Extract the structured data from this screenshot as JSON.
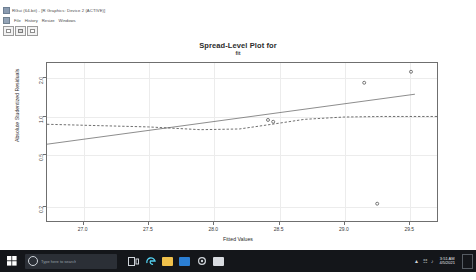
{
  "window": {
    "title": "RGui (64-bit) - [R Graphics: Device 2 (ACTIVE)]",
    "app_icon": "r-app-icon",
    "doc_icon": "r-document-icon",
    "menu": [
      "File",
      "History",
      "Resize",
      "Windows"
    ],
    "toolbar_buttons": [
      "copy-button",
      "print-button",
      "save-button"
    ]
  },
  "taskbar": {
    "start_label": "start-button",
    "search_placeholder": "Type here to search",
    "icons": [
      "task-view-icon",
      "edge-icon",
      "file-explorer-icon",
      "store-icon",
      "settings-icon",
      "r-taskbar-icon"
    ],
    "tray": [
      "show-hidden-icons",
      "network-icon",
      "volume-icon",
      "action-center-icon"
    ],
    "time": "3:51 AM",
    "date": "4/5/2021"
  },
  "chart_data": {
    "type": "scatter",
    "title": "Spread-Level Plot for",
    "subtitle": "fit",
    "xlabel": "Fitted Values",
    "ylabel": "Absolute Studentized Residuals",
    "grid": true,
    "legend": "none",
    "xlim": [
      26.72,
      29.72
    ],
    "ylim_log": [
      0.15,
      2.6
    ],
    "xticks": [
      27.0,
      27.5,
      28.0,
      28.5,
      29.0,
      29.5
    ],
    "yticks": [
      0.2,
      0.5,
      1.0,
      2.0
    ],
    "yscale": "log",
    "points": [
      {
        "x": 28.42,
        "y": 0.93
      },
      {
        "x": 28.46,
        "y": 0.9
      },
      {
        "x": 29.16,
        "y": 1.82
      },
      {
        "x": 29.52,
        "y": 2.22
      },
      {
        "x": 29.26,
        "y": 0.205
      }
    ],
    "series": [
      {
        "name": "Linear fit line",
        "style": "solid",
        "color": "#6f6f6f",
        "x": [
          26.72,
          29.55
        ],
        "y": [
          0.6,
          1.48
        ]
      },
      {
        "name": "Loess smooth",
        "style": "dashed",
        "color": "#4a4a4a",
        "x": [
          26.72,
          27.1,
          27.5,
          27.9,
          28.2,
          28.45,
          28.7,
          29.0,
          29.3,
          29.72
        ],
        "y": [
          0.86,
          0.84,
          0.82,
          0.78,
          0.79,
          0.86,
          0.94,
          0.98,
          0.99,
          0.99
        ]
      }
    ]
  }
}
